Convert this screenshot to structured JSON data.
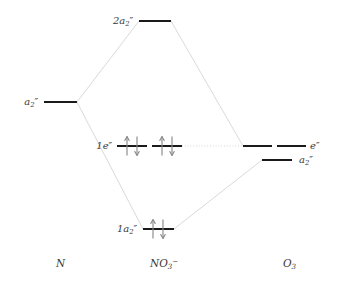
{
  "figure": {
    "kind": "molecular-orbital-correlation-diagram",
    "background_color": "#ffffff",
    "level_color": "#1a1a1a",
    "correlation_line_color": "#c8c8c8",
    "arrow_color": "#8a8a8a",
    "text_color": "#3a3a3a"
  },
  "columns": [
    {
      "id": "left",
      "label_html": "N",
      "label_x": 56,
      "label_y": 258
    },
    {
      "id": "center",
      "label_html": "NO<sub>3</sub><sup>−</sup>",
      "label_x": 150,
      "label_y": 258
    },
    {
      "id": "right",
      "label_html": "O<sub>3</sub>",
      "label_x": 283,
      "label_y": 258
    }
  ],
  "levels": [
    {
      "id": "left-a2pp",
      "column": "left",
      "label_html": "a<sub>2</sub><span class=\"prime\">″</span>",
      "label_side": "left",
      "label_x": 38,
      "label_y": 97,
      "segments": [
        {
          "x1": 44,
          "x2": 77,
          "y": 102
        }
      ],
      "electrons": []
    },
    {
      "id": "center-2a2pp",
      "column": "center",
      "label_html": "2a<sub>2</sub><span class=\"prime\">″</span>",
      "label_side": "left",
      "label_x": 133,
      "label_y": 16,
      "segments": [
        {
          "x1": 139,
          "x2": 171,
          "y": 21
        }
      ],
      "electrons": []
    },
    {
      "id": "center-1epp",
      "column": "center",
      "label_html": "1e<span class=\"prime\">″</span>",
      "label_side": "left",
      "label_x": 112,
      "label_y": 141,
      "segments": [
        {
          "x1": 117,
          "x2": 147,
          "y": 146
        },
        {
          "x1": 152,
          "x2": 182,
          "y": 146
        }
      ],
      "electrons": [
        {
          "segment": 0,
          "spin": "up",
          "x": 127,
          "y": 146
        },
        {
          "segment": 0,
          "spin": "down",
          "x": 137,
          "y": 146
        },
        {
          "segment": 1,
          "spin": "up",
          "x": 162,
          "y": 146
        },
        {
          "segment": 1,
          "spin": "down",
          "x": 172,
          "y": 146
        }
      ]
    },
    {
      "id": "center-1a2pp",
      "column": "center",
      "label_html": "1a<sub>2</sub><span class=\"prime\">″</span>",
      "label_side": "left",
      "label_x": 137,
      "label_y": 224,
      "segments": [
        {
          "x1": 143,
          "x2": 174,
          "y": 229
        }
      ],
      "electrons": [
        {
          "segment": 0,
          "spin": "up",
          "x": 153,
          "y": 229
        },
        {
          "segment": 0,
          "spin": "down",
          "x": 163,
          "y": 229
        }
      ]
    },
    {
      "id": "right-epp",
      "column": "right",
      "label_html": "e<span class=\"prime\">″</span>",
      "label_side": "right",
      "label_x": 310,
      "label_y": 141,
      "segments": [
        {
          "x1": 243,
          "x2": 272,
          "y": 146
        },
        {
          "x1": 277,
          "x2": 306,
          "y": 146
        }
      ],
      "electrons": []
    },
    {
      "id": "right-a2pp",
      "column": "right",
      "label_html": "a<sub>2</sub><span class=\"prime\">″</span>",
      "label_side": "right",
      "label_x": 299,
      "label_y": 155,
      "segments": [
        {
          "x1": 262,
          "x2": 292,
          "y": 160
        }
      ],
      "electrons": []
    }
  ],
  "correlation_lines": [
    {
      "from": "left-a2pp",
      "to": "center-2a2pp",
      "x1": 77,
      "y1": 102,
      "x2": 139,
      "y2": 21,
      "style": "solid"
    },
    {
      "from": "left-a2pp",
      "to": "center-1a2pp",
      "x1": 77,
      "y1": 102,
      "x2": 143,
      "y2": 229,
      "style": "solid"
    },
    {
      "from": "center-2a2pp",
      "to": "right-epp",
      "x1": 171,
      "y1": 21,
      "x2": 243,
      "y2": 146,
      "style": "solid"
    },
    {
      "from": "center-1a2pp",
      "to": "right-a2pp",
      "x1": 174,
      "y1": 229,
      "x2": 262,
      "y2": 160,
      "style": "solid"
    },
    {
      "from": "center-1epp",
      "to": "right-epp",
      "x1": 182,
      "y1": 146,
      "x2": 243,
      "y2": 146,
      "style": "dotted"
    }
  ],
  "chart_data": {
    "type": "diagram",
    "xlabel": "",
    "ylabel": "Energy",
    "grid": false,
    "legend": "none",
    "fragments": [
      "N",
      "NO3-",
      "O3"
    ],
    "orbitals": [
      {
        "fragment": "N",
        "label": "a2″",
        "energy_px": 102,
        "electrons": 0,
        "degeneracy": 1
      },
      {
        "fragment": "NO3-",
        "label": "2a2″",
        "energy_px": 21,
        "electrons": 0,
        "degeneracy": 1
      },
      {
        "fragment": "NO3-",
        "label": "1e″",
        "energy_px": 146,
        "electrons": 4,
        "degeneracy": 2
      },
      {
        "fragment": "NO3-",
        "label": "1a2″",
        "energy_px": 229,
        "electrons": 2,
        "degeneracy": 1
      },
      {
        "fragment": "O3",
        "label": "e″",
        "energy_px": 146,
        "electrons": 0,
        "degeneracy": 2
      },
      {
        "fragment": "O3",
        "label": "a2″",
        "energy_px": 160,
        "electrons": 0,
        "degeneracy": 1
      }
    ],
    "total_electrons_shown": 6
  }
}
